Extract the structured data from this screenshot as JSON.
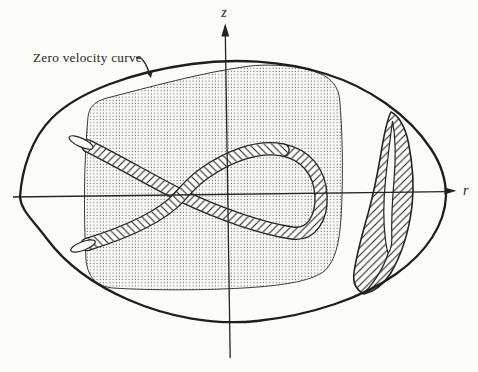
{
  "figure": {
    "title_label": "Zero velocity curve",
    "axis": {
      "vertical": "z",
      "horizontal": "r"
    },
    "colors": {
      "ink": "#242424",
      "paper": "#fcfcf9",
      "stipple_dot": "#6b6b6b"
    },
    "elements": {
      "outer_boundary": "zero-velocity-oval",
      "stippled_region": "stippled-region",
      "ribbon": "hatched-trajectory-tube",
      "crescent": "hatched-crescent"
    }
  }
}
